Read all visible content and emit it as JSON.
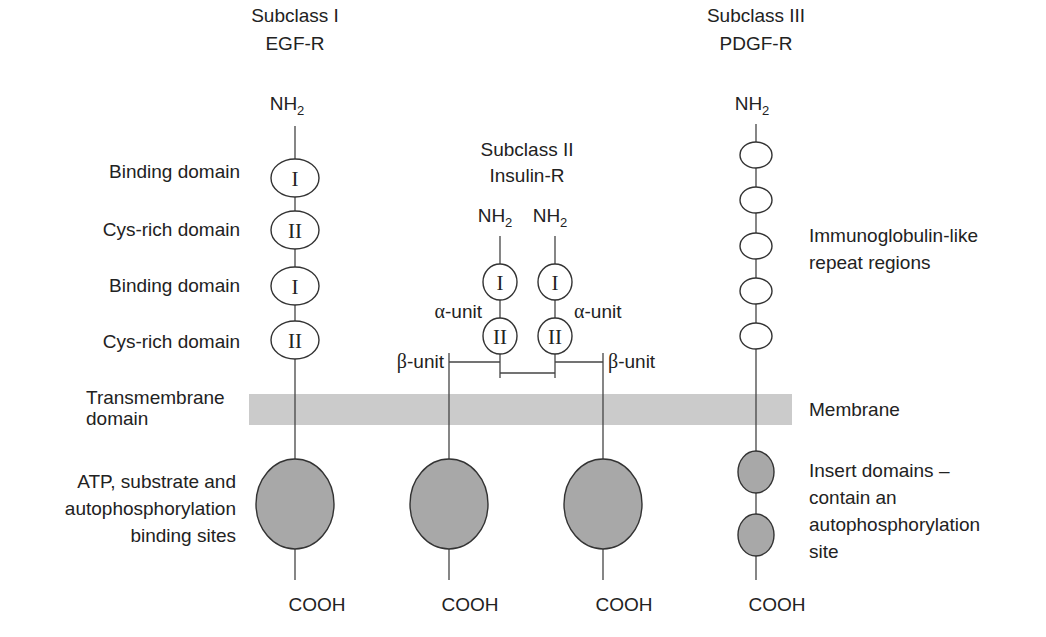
{
  "colors": {
    "membrane": "#cbcbcb",
    "kinase_domain": "#a8a8a8",
    "outline": "#333333",
    "text": "#222222"
  },
  "subclass1": {
    "title": "Subclass I",
    "name": "EGF-R",
    "n_terminus": "NH",
    "n_sub": "2",
    "domains": [
      {
        "symbol": "I",
        "label": "Binding domain"
      },
      {
        "symbol": "II",
        "label": "Cys-rich domain"
      },
      {
        "symbol": "I",
        "label": "Binding domain"
      },
      {
        "symbol": "II",
        "label": "Cys-rich domain"
      }
    ],
    "transmembrane_label_line1": "Transmembrane",
    "transmembrane_label_line2": "domain",
    "kinase_label_line1": "ATP, substrate and",
    "kinase_label_line2": "autophosphorylation",
    "kinase_label_line3": "binding sites",
    "c_terminus": "COOH"
  },
  "subclass2": {
    "title": "Subclass II",
    "name": "Insulin-R",
    "n_terminus": "NH",
    "n_sub": "2",
    "alpha_domains": [
      "I",
      "II"
    ],
    "alpha_label": "-unit",
    "alpha_symbol": "α",
    "beta_label": "-unit",
    "beta_symbol": "β",
    "c_terminus": "COOH"
  },
  "subclass3": {
    "title": "Subclass III",
    "name": "PDGF-R",
    "n_terminus": "NH",
    "n_sub": "2",
    "ig_repeat_count": 5,
    "ig_label_line1": "Immunoglobulin-like",
    "ig_label_line2": "repeat regions",
    "membrane_label": "Membrane",
    "insert_label_line1": "Insert domains –",
    "insert_label_line2": "contain an",
    "insert_label_line3": "autophosphorylation",
    "insert_label_line4": "site",
    "c_terminus": "COOH"
  }
}
